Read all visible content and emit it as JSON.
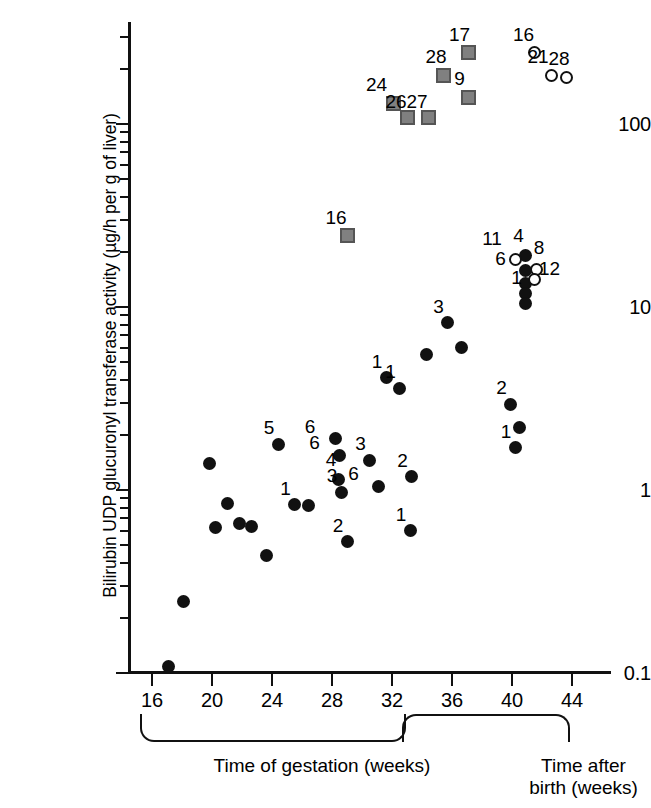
{
  "chart_data": {
    "type": "scatter",
    "title": "",
    "xlabel": "Time of gestation (weeks)",
    "xlabel_secondary": "Time after birth (weeks)",
    "ylabel": "Bilirubin UDP glucuronyl transferase activity (µg/h per g of liver)",
    "yscale": "log",
    "ylim": [
      0.1,
      300
    ],
    "xlim": [
      14.5,
      46
    ],
    "grid": false,
    "legend": "none",
    "ytick_labels": [
      "0.1",
      "1",
      "10",
      "100"
    ],
    "ytick_values": [
      0.1,
      1,
      10,
      100
    ],
    "xtick_labels": [
      "16",
      "20",
      "24",
      "28",
      "32",
      "36",
      "40",
      "44"
    ],
    "xtick_values": [
      16,
      20,
      24,
      28,
      32,
      36,
      40,
      44
    ],
    "series": [
      {
        "name": "fetal/neonatal liver (filled circle)",
        "marker": "filled-circle",
        "points": [
          {
            "x": 17.1,
            "y": 0.108,
            "label": ""
          },
          {
            "x": 18.1,
            "y": 0.245,
            "label": ""
          },
          {
            "x": 19.8,
            "y": 1.4,
            "label": ""
          },
          {
            "x": 20.2,
            "y": 0.62,
            "label": ""
          },
          {
            "x": 21.0,
            "y": 0.84,
            "label": ""
          },
          {
            "x": 21.8,
            "y": 0.66,
            "label": ""
          },
          {
            "x": 22.6,
            "y": 0.63,
            "label": ""
          },
          {
            "x": 23.6,
            "y": 0.44,
            "label": ""
          },
          {
            "x": 24.4,
            "y": 1.78,
            "label": "5"
          },
          {
            "x": 25.5,
            "y": 0.83,
            "label": "1"
          },
          {
            "x": 26.4,
            "y": 0.82,
            "label": ""
          },
          {
            "x": 28.2,
            "y": 1.9,
            "label": "6"
          },
          {
            "x": 28.5,
            "y": 1.55,
            "label": "6"
          },
          {
            "x": 28.4,
            "y": 1.14,
            "label": "4"
          },
          {
            "x": 28.6,
            "y": 0.97,
            "label": "3"
          },
          {
            "x": 29.0,
            "y": 0.52,
            "label": "2"
          },
          {
            "x": 30.5,
            "y": 1.45,
            "label": "3"
          },
          {
            "x": 31.1,
            "y": 1.05,
            "label": "6"
          },
          {
            "x": 31.6,
            "y": 4.1,
            "label": "1"
          },
          {
            "x": 32.5,
            "y": 3.6,
            "label": "1"
          },
          {
            "x": 33.3,
            "y": 1.18,
            "label": "2"
          },
          {
            "x": 33.2,
            "y": 0.6,
            "label": "1"
          },
          {
            "x": 34.3,
            "y": 5.5,
            "label": ""
          },
          {
            "x": 35.7,
            "y": 8.2,
            "label": "3"
          },
          {
            "x": 36.6,
            "y": 6.0,
            "label": ""
          },
          {
            "x": 39.9,
            "y": 2.95,
            "label": "2"
          },
          {
            "x": 40.5,
            "y": 2.2,
            "label": ""
          },
          {
            "x": 40.2,
            "y": 1.7,
            "label": "1"
          },
          {
            "x": 40.9,
            "y": 19.0,
            "label": "4"
          },
          {
            "x": 40.9,
            "y": 15.8,
            "label": "6"
          },
          {
            "x": 40.9,
            "y": 13.5,
            "label": ""
          },
          {
            "x": 40.9,
            "y": 11.8,
            "label": "1"
          },
          {
            "x": 40.9,
            "y": 10.4,
            "label": ""
          }
        ]
      },
      {
        "name": "postnatal liver (open circle)",
        "marker": "open-circle",
        "points": [
          {
            "x": 40.2,
            "y": 18.2,
            "label": "11"
          },
          {
            "x": 41.6,
            "y": 16.0,
            "label": "8"
          },
          {
            "x": 41.5,
            "y": 14.2,
            "label": "12"
          },
          {
            "x": 41.5,
            "y": 245,
            "label": "16"
          },
          {
            "x": 42.6,
            "y": 185,
            "label": "21"
          },
          {
            "x": 43.6,
            "y": 180,
            "label": "28"
          }
        ]
      },
      {
        "name": "adult / induced (grey square)",
        "marker": "square",
        "points": [
          {
            "x": 29.0,
            "y": 24.5,
            "label": "16"
          },
          {
            "x": 32.1,
            "y": 130,
            "label": "24"
          },
          {
            "x": 33.0,
            "y": 108,
            "label": "26"
          },
          {
            "x": 34.4,
            "y": 108,
            "label": "27"
          },
          {
            "x": 35.4,
            "y": 185,
            "label": "28"
          },
          {
            "x": 37.1,
            "y": 245,
            "label": "17"
          },
          {
            "x": 37.1,
            "y": 140,
            "label": "9"
          }
        ]
      }
    ]
  },
  "axes": {
    "y_title": "Bilirubin UDP glucuronyl transferase activity (µg/h per g of liver)",
    "y_ticks": [
      {
        "label": "100",
        "value": 100
      },
      {
        "label": "10",
        "value": 10
      },
      {
        "label": "1",
        "value": 1
      },
      {
        "label": "0.1",
        "value": 0.1
      }
    ],
    "x_ticks": [
      {
        "label": "16",
        "value": 16
      },
      {
        "label": "20",
        "value": 20
      },
      {
        "label": "24",
        "value": 24
      },
      {
        "label": "28",
        "value": 28
      },
      {
        "label": "32",
        "value": 32
      },
      {
        "label": "36",
        "value": 36
      },
      {
        "label": "40",
        "value": 40
      },
      {
        "label": "44",
        "value": 44
      }
    ]
  },
  "captions": {
    "gestation": "Time of gestation (weeks)",
    "postnatal_line1": "Time after",
    "postnatal_line2": "birth (weeks)"
  },
  "colors": {
    "axis": "#111111",
    "filled_marker": "#111111",
    "open_marker_fill": "#ffffff",
    "square_marker_fill": "#808080",
    "square_marker_border": "#555555",
    "background": "#ffffff"
  }
}
